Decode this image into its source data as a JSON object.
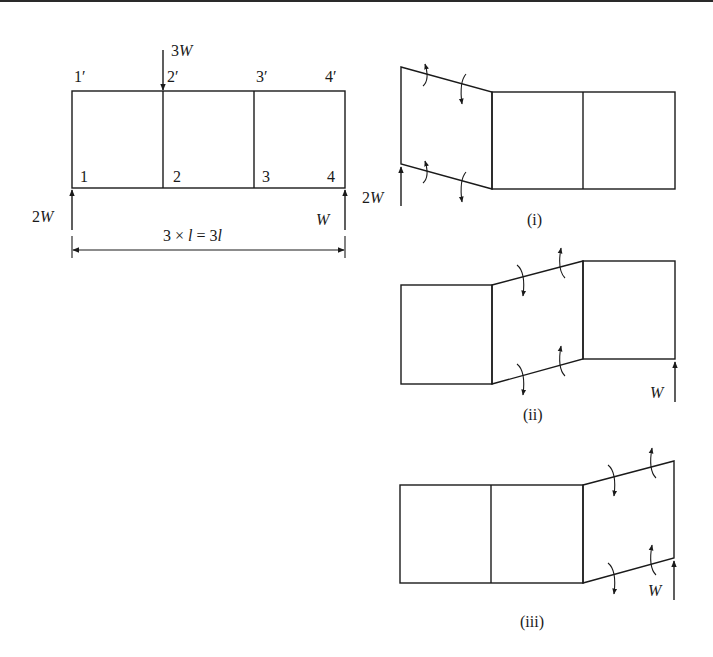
{
  "figure": {
    "original_frame": {
      "nodes_top": [
        "1′",
        "2′",
        "3′",
        "4′"
      ],
      "nodes_bottom": [
        "1",
        "2",
        "3",
        "4"
      ],
      "applied_load": {
        "value": "3",
        "unit": "W",
        "position": "node 2′",
        "direction": "down"
      },
      "reaction_left": {
        "value": "2",
        "unit": "W",
        "position": "node 1",
        "direction": "up"
      },
      "reaction_right": {
        "value": "",
        "unit": "W",
        "position": "node 4",
        "direction": "up"
      },
      "dimension": {
        "prefix": "3 × ",
        "var": "l",
        "eq": " = 3",
        "var2": "l"
      }
    },
    "deformed_shapes": [
      {
        "label": "(i)",
        "sheared_panel": 1,
        "force_label": "2W",
        "force_side": "left"
      },
      {
        "label": "(ii)",
        "sheared_panel": 2,
        "force_label": "W",
        "force_side": "right"
      },
      {
        "label": "(iii)",
        "sheared_panel": 3,
        "force_label": "W",
        "force_side": "right"
      }
    ]
  },
  "labels": {
    "n1p": "1′",
    "n2p": "2′",
    "n3p": "3′",
    "n4p": "4′",
    "n1": "1",
    "n2": "2",
    "n3": "3",
    "n4": "4",
    "load_num": "3",
    "load_w": "W",
    "react_left_num": "2",
    "react_left_w": "W",
    "react_right_w": "W",
    "dim_a": "3 × ",
    "dim_l": "l",
    "dim_b": " = 3",
    "dim_l2": "l",
    "case_i": "(i)",
    "case_ii": "(ii)",
    "case_iii": "(iii)",
    "case_i_force_num": "2",
    "case_i_force_w": "W",
    "case_ii_force_w": "W",
    "case_iii_force_w": "W"
  }
}
